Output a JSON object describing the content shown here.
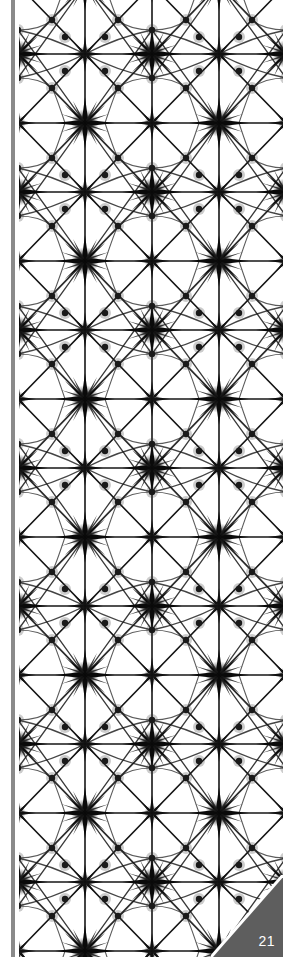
{
  "page": {
    "number": "21",
    "colors": {
      "ink": "#111111",
      "spine_bar": "#8a8a8a",
      "corner_tab": "#5e5e5e",
      "corner_border": "#ffffff",
      "page_number": "#ffffff"
    },
    "pattern": {
      "motif": "eight-point star grid",
      "tile_width": 134,
      "tile_height": 138
    }
  }
}
